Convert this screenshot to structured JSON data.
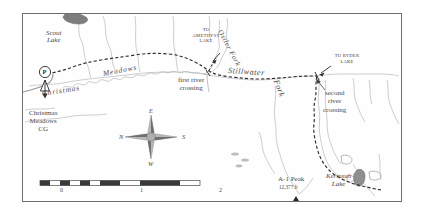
{
  "map": {
    "title_labels": {
      "scout_lake": "Scout\nLake",
      "christmas_meadows": "Christmas",
      "christmas_meadows2": "Meadows",
      "christmas_meadows_cg": "Christmas\nMeadows\nCG",
      "to_amethyst_lake": "TO\nAMETHYST\nLAKE",
      "to_ryder_lake": "TO RYDER\nLAKE",
      "ostler_fork": "Ostler Fork",
      "stillwater": "Stillwater",
      "fork": "Fork",
      "first_river_crossing": "first river\ncrossing",
      "second_river_crossing": "second\nriver\ncrossing",
      "a1_peak": "A-1 Peak",
      "a1_peak_elev": "12,377 ft",
      "kermsuh_lake": "Kermsuh\nLake"
    },
    "compass": {
      "north": "N",
      "east": "E",
      "south": "S",
      "west": "W"
    },
    "scale_bar": {
      "ticks": [
        "0",
        "1",
        "2"
      ],
      "units": "Miles"
    },
    "symbols": {
      "parking": "P",
      "trailhead_icon": "trailhead-marker",
      "peak_icon": "peak-triangle"
    },
    "colors": {
      "border": "#6e6e6e",
      "trail": "#3c3c3c",
      "river": "#9a9a9a",
      "lake_fill": "#8f8f8f",
      "text": "#4a4a4a",
      "background": "#fefefe"
    }
  }
}
